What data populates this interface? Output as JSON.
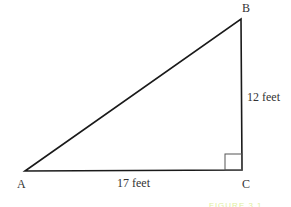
{
  "figure": {
    "type": "right-triangle",
    "vertices": {
      "A": {
        "label": "A"
      },
      "B": {
        "label": "B"
      },
      "C": {
        "label": "C"
      }
    },
    "sides": {
      "AC": {
        "label": "17 feet"
      },
      "BC": {
        "label": "12 feet"
      }
    },
    "right_angle_at": "C",
    "caption": "FIGURE 3.1",
    "colors": {
      "stroke": "#1a1a1a",
      "caption": "#dfeea0"
    }
  }
}
